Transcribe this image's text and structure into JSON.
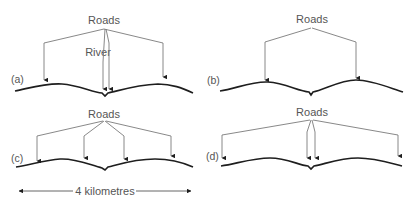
{
  "diagram": {
    "title": "",
    "colors": {
      "text": "#555555",
      "road_line": "#7a7a7a",
      "ground": "#1e1e1e",
      "background": "#ffffff"
    },
    "panels": [
      {
        "id": "a",
        "label": "(a)",
        "roads_label": "Roads",
        "river_label": "River",
        "road_count": 4,
        "road_positions_desc": "two at outer positions, two converging at river crossing in center"
      },
      {
        "id": "b",
        "label": "(b)",
        "roads_label": "Roads",
        "road_count": 2,
        "road_positions_desc": "two roads, one on each side of the river"
      },
      {
        "id": "c",
        "label": "(c)",
        "roads_label": "Roads",
        "road_count": 4,
        "road_positions_desc": "four roads evenly spread, two on each side of the river"
      },
      {
        "id": "d",
        "label": "(d)",
        "roads_label": "Roads",
        "road_count": 4,
        "road_positions_desc": "two at far ends, two at the center river crossing"
      }
    ],
    "scale_bar": {
      "label": "4 kilometres"
    }
  }
}
